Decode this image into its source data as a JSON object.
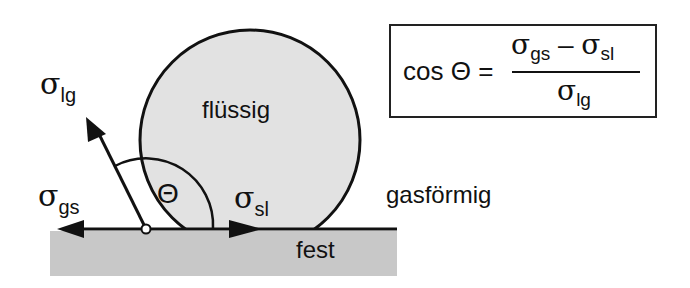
{
  "diagram": {
    "phases": {
      "liquid": "flüssig",
      "gas": "gasförmig",
      "solid": "fest"
    },
    "tensions": {
      "sigma_symbol": "σ",
      "liquid_gas_sub": "lg",
      "gas_solid_sub": "gs",
      "solid_liquid_sub": "sl"
    },
    "angle_symbol": "Θ",
    "formula": {
      "lhs": "cos Θ =",
      "numerator_a_sub": "gs",
      "minus": "–",
      "numerator_b_sub": "sl",
      "denominator_sub": "lg"
    },
    "colors": {
      "droplet_fill": "#e2e2e2",
      "substrate_fill": "#c8c8c8",
      "stroke": "#111111"
    }
  }
}
